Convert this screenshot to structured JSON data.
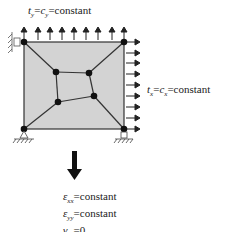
{
  "diagram": {
    "top_traction": {
      "t_symbol": "t",
      "t_sub": "y",
      "c_symbol": "c",
      "c_sub": "y",
      "rhs": "constant"
    },
    "right_traction": {
      "t_symbol": "t",
      "t_sub": "x",
      "c_symbol": "c",
      "c_sub": "x",
      "rhs": "constant"
    },
    "result": {
      "lines": [
        {
          "symbol": "ε",
          "sub": "xx",
          "rhs": "constant"
        },
        {
          "symbol": "ε",
          "sub": "yy",
          "rhs": "constant"
        },
        {
          "symbol": "γ",
          "sub": "xy",
          "rhs": "0"
        }
      ]
    },
    "colors": {
      "fill": "#d3d3d3",
      "stroke": "#333333",
      "node": "#111111",
      "arrow": "#222222"
    },
    "nodes": [
      {
        "x": 24,
        "y": 42
      },
      {
        "x": 124,
        "y": 42
      },
      {
        "x": 24,
        "y": 129
      },
      {
        "x": 124,
        "y": 129
      },
      {
        "x": 56,
        "y": 72
      },
      {
        "x": 89,
        "y": 73
      },
      {
        "x": 58,
        "y": 102
      },
      {
        "x": 94,
        "y": 96
      }
    ]
  }
}
